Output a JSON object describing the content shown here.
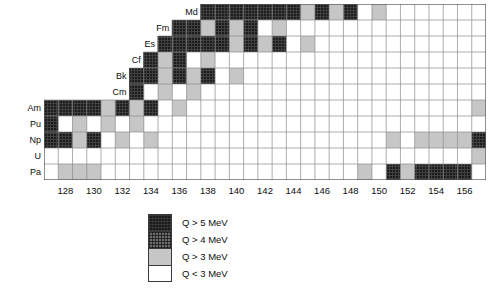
{
  "chart_data": {
    "type": "heatmap",
    "title": "",
    "xlabel": "",
    "ylabel": "",
    "x_tick_labels": [
      "128",
      "130",
      "132",
      "134",
      "136",
      "138",
      "140",
      "142",
      "144",
      "146",
      "148",
      "150",
      "152",
      "154",
      "156"
    ],
    "x_tick_values": [
      128,
      130,
      132,
      134,
      136,
      138,
      140,
      142,
      144,
      146,
      148,
      150,
      152,
      154,
      156
    ],
    "x_range": [
      127,
      158
    ],
    "y_tick_labels": [
      "Md",
      "Fm",
      "Es",
      "Cf",
      "Bk",
      "Cm",
      "Am",
      "Pu",
      "Np",
      "U",
      "Pa"
    ],
    "categories_y_bottom_to_top": [
      "Pa",
      "U",
      "Np",
      "Pu",
      "Am",
      "Cm",
      "Bk",
      "Cf",
      "Es",
      "Fm",
      "Md"
    ],
    "grid": true,
    "legend_position": "below-center",
    "value_levels": [
      {
        "key": "q5",
        "label": "Q > 5 MeV",
        "color": "#1c1c1c"
      },
      {
        "key": "q4",
        "label": "Q > 4 MeV",
        "color": "#6b6b6b"
      },
      {
        "key": "q3",
        "label": "Q > 3 MeV",
        "color": "#c6c6c6"
      },
      {
        "key": "q0",
        "label": "Q < 3 MeV",
        "color": "#ffffff"
      }
    ],
    "rows": [
      {
        "element": "Md",
        "n_start": 138,
        "n_end": 158,
        "cells": [
          "q5",
          "q5",
          "q5",
          "q5",
          "q5",
          "q5",
          "q5",
          "q3",
          "q5",
          "q3",
          "q5",
          "q0",
          "q3",
          "q0",
          "q0",
          "q0",
          "q0",
          "q0",
          "q0",
          "q0"
        ]
      },
      {
        "element": "Fm",
        "n_start": 136,
        "n_end": 158,
        "cells": [
          "q5",
          "q5",
          "q3",
          "q5",
          "q3",
          "q5",
          "q0",
          "q3",
          "q0",
          "q0",
          "q0",
          "q0",
          "q0",
          "q0",
          "q0",
          "q0",
          "q0",
          "q0",
          "q0",
          "q0",
          "q0",
          "q0"
        ]
      },
      {
        "element": "Es",
        "n_start": 135,
        "n_end": 158,
        "cells": [
          "q5",
          "q5",
          "q5",
          "q5",
          "q5",
          "q3",
          "q5",
          "q3",
          "q5",
          "q0",
          "q3",
          "q0",
          "q0",
          "q0",
          "q0",
          "q0",
          "q0",
          "q0",
          "q0",
          "q0",
          "q0",
          "q0",
          "q0"
        ]
      },
      {
        "element": "Cf",
        "n_start": 134,
        "n_end": 158,
        "cells": [
          "q5",
          "q3",
          "q5",
          "q0",
          "q3",
          "q0",
          "q0",
          "q0",
          "q0",
          "q0",
          "q0",
          "q0",
          "q0",
          "q0",
          "q0",
          "q0",
          "q0",
          "q0",
          "q0",
          "q0",
          "q0",
          "q0",
          "q0",
          "q0"
        ]
      },
      {
        "element": "Bk",
        "n_start": 133,
        "n_end": 158,
        "cells": [
          "q5",
          "q5",
          "q3",
          "q5",
          "q3",
          "q5",
          "q0",
          "q3",
          "q0",
          "q0",
          "q0",
          "q0",
          "q0",
          "q0",
          "q0",
          "q0",
          "q0",
          "q0",
          "q0",
          "q0",
          "q0",
          "q0",
          "q0",
          "q0",
          "q0"
        ]
      },
      {
        "element": "Cm",
        "n_start": 133,
        "n_end": 158,
        "cells": [
          "q5",
          "q0",
          "q3",
          "q0",
          "q3",
          "q0",
          "q0",
          "q0",
          "q0",
          "q0",
          "q0",
          "q0",
          "q0",
          "q0",
          "q0",
          "q0",
          "q0",
          "q0",
          "q0",
          "q0",
          "q0",
          "q0",
          "q0",
          "q0",
          "q0"
        ]
      },
      {
        "element": "Am",
        "n_start": 127,
        "n_end": 158,
        "cells": [
          "q5",
          "q5",
          "q5",
          "q5",
          "q3",
          "q5",
          "q3",
          "q5",
          "q0",
          "q3",
          "q0",
          "q0",
          "q0",
          "q0",
          "q0",
          "q0",
          "q0",
          "q0",
          "q0",
          "q0",
          "q0",
          "q0",
          "q0",
          "q0",
          "q0",
          "q0",
          "q0",
          "q0",
          "q0",
          "q0",
          "q3"
        ]
      },
      {
        "element": "Pu",
        "n_start": 127,
        "n_end": 158,
        "cells": [
          "q5",
          "q0",
          "q3",
          "q0",
          "q3",
          "q0",
          "q3",
          "q0",
          "q0",
          "q0",
          "q0",
          "q0",
          "q0",
          "q0",
          "q0",
          "q0",
          "q0",
          "q0",
          "q0",
          "q0",
          "q0",
          "q0",
          "q0",
          "q0",
          "q0",
          "q0",
          "q0",
          "q0",
          "q0",
          "q0",
          "q0"
        ]
      },
      {
        "element": "Np",
        "n_start": 127,
        "n_end": 158,
        "cells": [
          "q5",
          "q5",
          "q3",
          "q5",
          "q0",
          "q3",
          "q0",
          "q3",
          "q0",
          "q0",
          "q0",
          "q0",
          "q0",
          "q0",
          "q0",
          "q0",
          "q0",
          "q0",
          "q0",
          "q0",
          "q0",
          "q0",
          "q0",
          "q0",
          "q3",
          "q0",
          "q3",
          "q3",
          "q3",
          "q3",
          "q5"
        ]
      },
      {
        "element": "U",
        "n_start": 127,
        "n_end": 158,
        "cells": [
          "q0",
          "q0",
          "q0",
          "q0",
          "q0",
          "q0",
          "q0",
          "q0",
          "q0",
          "q0",
          "q0",
          "q0",
          "q0",
          "q0",
          "q0",
          "q0",
          "q0",
          "q0",
          "q0",
          "q0",
          "q0",
          "q0",
          "q0",
          "q0",
          "q0",
          "q0",
          "q0",
          "q0",
          "q0",
          "q0",
          "q3"
        ]
      },
      {
        "element": "Pa",
        "n_start": 127,
        "n_end": 158,
        "cells": [
          "q0",
          "q3",
          "q3",
          "q3",
          "q0",
          "q0",
          "q0",
          "q0",
          "q0",
          "q0",
          "q0",
          "q0",
          "q0",
          "q0",
          "q0",
          "q0",
          "q0",
          "q0",
          "q0",
          "q0",
          "q0",
          "q0",
          "q3",
          "q0",
          "q5",
          "q3",
          "q5",
          "q5",
          "q5",
          "q5",
          "q0"
        ]
      }
    ]
  },
  "legend": {
    "items": [
      {
        "swatch": "q5",
        "label": "Q > 5 MeV"
      },
      {
        "swatch": "q4",
        "label": "Q > 4 MeV"
      },
      {
        "swatch": "q3",
        "label": "Q > 3 MeV"
      },
      {
        "swatch": "q0",
        "label": "Q < 3 MeV"
      }
    ]
  }
}
